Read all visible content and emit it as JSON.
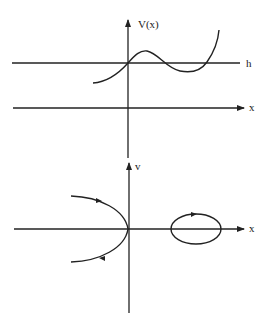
{
  "top_plot": {
    "y_axis_label": "V(x)",
    "x_axis_label": "x",
    "level_label": "h",
    "curve": "potential V(x) crossing h at origin, local max then local min, rising steeply"
  },
  "bottom_plot": {
    "y_axis_label": "v",
    "x_axis_label": "x",
    "trajectories": [
      {
        "type": "open-parabola",
        "direction": "right on top, left on bottom"
      },
      {
        "type": "closed-orbit",
        "direction": "clockwise"
      }
    ]
  },
  "colors": {
    "line": "#222222",
    "background": "#ffffff"
  }
}
